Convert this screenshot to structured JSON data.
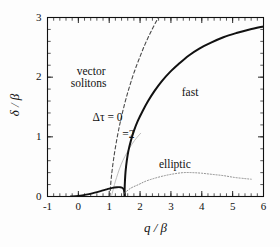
{
  "figure": {
    "background": "#fdfdfd",
    "frame_color": "#111111"
  },
  "axes": {
    "x_title": "q / β",
    "y_title": "δ / β",
    "x_ticklabels": [
      "-1",
      "0",
      "1",
      "2",
      "3",
      "4",
      "5",
      "6"
    ],
    "y_ticklabels": [
      "0",
      "1",
      "2",
      "3"
    ]
  },
  "annotations": {
    "vector": "vector",
    "solitons": "solitons",
    "dtau0": "Δτ = 0",
    "dtau2": "=2",
    "fast": "fast",
    "elliptic": "elliptic"
  },
  "chart_data": {
    "type": "line",
    "title": "",
    "xlabel": "q / β",
    "ylabel": "δ / β",
    "xlim": [
      -1,
      6
    ],
    "ylim": [
      0,
      3
    ],
    "xticks": [
      -1,
      0,
      1,
      2,
      3,
      4,
      5,
      6
    ],
    "yticks": [
      0,
      1,
      2,
      3
    ],
    "xminor_step": 0.2,
    "yminor_step": 0.2,
    "grid": false,
    "legend": "inline-annotations",
    "series": [
      {
        "name": "Δτ = 0",
        "label": "Δτ = 0",
        "style": "dashed",
        "color": "#4a4a4a",
        "width": 1.1,
        "points": [
          [
            1.02,
            0.0
          ],
          [
            1.05,
            0.22
          ],
          [
            1.09,
            0.42
          ],
          [
            1.14,
            0.62
          ],
          [
            1.2,
            0.82
          ],
          [
            1.28,
            1.05
          ],
          [
            1.36,
            1.25
          ],
          [
            1.45,
            1.45
          ],
          [
            1.56,
            1.67
          ],
          [
            1.68,
            1.88
          ],
          [
            1.82,
            2.1
          ],
          [
            1.98,
            2.32
          ],
          [
            2.16,
            2.55
          ],
          [
            2.36,
            2.77
          ],
          [
            2.56,
            2.97
          ],
          [
            2.6,
            3.0
          ]
        ]
      },
      {
        "name": "Δτ = 2",
        "label": "=2",
        "style": "solid-thin",
        "color": "#b6b6b6",
        "width": 0.9,
        "points": [
          [
            1.08,
            0.02
          ],
          [
            1.12,
            0.1
          ],
          [
            1.17,
            0.2
          ],
          [
            1.24,
            0.32
          ],
          [
            1.33,
            0.46
          ],
          [
            1.44,
            0.6
          ],
          [
            1.58,
            0.74
          ],
          [
            1.74,
            0.88
          ],
          [
            1.9,
            0.99
          ],
          [
            2.02,
            1.06
          ]
        ]
      },
      {
        "name": "fast",
        "label": "fast",
        "style": "solid-thick",
        "color": "#111111",
        "width": 2.0,
        "points": [
          [
            1.5,
            0.0
          ],
          [
            1.5,
            0.12
          ],
          [
            1.51,
            0.26
          ],
          [
            1.53,
            0.42
          ],
          [
            1.57,
            0.6
          ],
          [
            1.62,
            0.76
          ],
          [
            1.7,
            0.93
          ],
          [
            1.8,
            1.1
          ],
          [
            1.93,
            1.27
          ],
          [
            2.08,
            1.43
          ],
          [
            2.26,
            1.6
          ],
          [
            2.47,
            1.77
          ],
          [
            2.7,
            1.93
          ],
          [
            2.96,
            2.08
          ],
          [
            3.25,
            2.22
          ],
          [
            3.57,
            2.36
          ],
          [
            3.92,
            2.48
          ],
          [
            4.3,
            2.58
          ],
          [
            4.7,
            2.67
          ],
          [
            5.12,
            2.74
          ],
          [
            5.55,
            2.8
          ],
          [
            6.0,
            2.85
          ]
        ]
      },
      {
        "name": "slow-lower-branch",
        "label": "",
        "style": "solid-thick",
        "color": "#111111",
        "width": 1.8,
        "points": [
          [
            -0.25,
            0.0
          ],
          [
            0.0,
            0.01
          ],
          [
            0.25,
            0.03
          ],
          [
            0.5,
            0.06
          ],
          [
            0.72,
            0.09
          ],
          [
            0.92,
            0.12
          ],
          [
            1.1,
            0.145
          ],
          [
            1.25,
            0.155
          ],
          [
            1.36,
            0.155
          ],
          [
            1.44,
            0.14
          ],
          [
            1.48,
            0.1
          ],
          [
            1.5,
            0.04
          ],
          [
            1.5,
            0.0
          ]
        ]
      },
      {
        "name": "elliptic",
        "label": "elliptic",
        "style": "dotted",
        "color": "#8c8c8c",
        "width": 1.0,
        "points": [
          [
            1.5,
            0.06
          ],
          [
            1.7,
            0.14
          ],
          [
            1.95,
            0.2
          ],
          [
            2.2,
            0.26
          ],
          [
            2.5,
            0.31
          ],
          [
            2.8,
            0.35
          ],
          [
            3.1,
            0.38
          ],
          [
            3.4,
            0.4
          ],
          [
            3.7,
            0.4
          ],
          [
            4.0,
            0.39
          ],
          [
            4.35,
            0.37
          ],
          [
            4.7,
            0.35
          ],
          [
            5.05,
            0.32
          ],
          [
            5.4,
            0.3
          ],
          [
            5.6,
            0.29
          ]
        ]
      }
    ]
  }
}
